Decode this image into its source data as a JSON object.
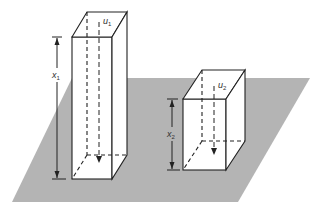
{
  "diagram": {
    "colors": {
      "plane": "#b4b4b4",
      "line": "#222222",
      "background": "#ffffff"
    },
    "labels": {
      "u1": {
        "base": "u",
        "sub": "1"
      },
      "x1": {
        "base": "x",
        "sub": "1"
      },
      "u2": {
        "base": "u",
        "sub": "2"
      },
      "x2": {
        "base": "x",
        "sub": "2"
      }
    }
  }
}
